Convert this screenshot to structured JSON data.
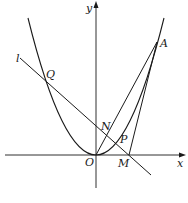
{
  "figure": {
    "axes": {
      "x_label": "x",
      "y_label": "y",
      "origin_label": "O"
    },
    "curve": {
      "type": "parabola",
      "vertex": "O",
      "opens": "up"
    },
    "line_label": "l",
    "points": [
      {
        "name": "A",
        "label": "A"
      },
      {
        "name": "Q",
        "label": "Q"
      },
      {
        "name": "N",
        "label": "N"
      },
      {
        "name": "P",
        "label": "P"
      },
      {
        "name": "M",
        "label": "M"
      }
    ],
    "segments": [
      "OA",
      "MA"
    ],
    "caption": ""
  },
  "colors": {
    "stroke": "#1a1a1a",
    "background": "#ffffff"
  }
}
